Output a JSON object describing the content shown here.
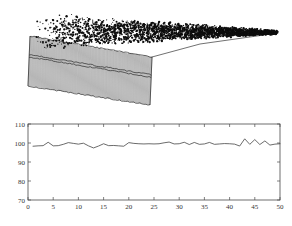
{
  "figure": {
    "background_color": "#ffffff",
    "axis_color": "#4a4a4a",
    "line_color": "#3a3a3a",
    "mesh_color": "#2a2a2a",
    "noise_color": "#0d0d0d"
  },
  "panels": {
    "surface": {
      "name": "3d-waterfall-surface-plot",
      "description": "3D waterfall / surface mesh plot with dense dark noise on the top surface and vertically hatched side walls"
    },
    "line": {
      "name": "2d-line-plot",
      "description": "2D time-series line plot of a noisy signal"
    }
  },
  "chart_data": [
    {
      "type": "surface",
      "title": "",
      "xlabel": "",
      "ylabel": "",
      "zlabel": "",
      "grid": false,
      "legend": null,
      "axis_visible": false,
      "n_rows": 3,
      "n_cols": 60,
      "surface_texture": "dense random noise speckle",
      "wall_texture": "dense vertical mesh lines"
    },
    {
      "type": "line",
      "title": "",
      "xlabel": "",
      "ylabel": "",
      "grid": false,
      "legend": null,
      "xlim": [
        0,
        50
      ],
      "ylim": [
        70,
        110
      ],
      "xticks": [
        0,
        5,
        10,
        15,
        20,
        25,
        30,
        35,
        40,
        45,
        50
      ],
      "yticks": [
        70,
        80,
        90,
        100,
        110
      ],
      "xticklabels": [
        "0",
        "5",
        "10",
        "15",
        "20",
        "25",
        "30",
        "35",
        "40",
        "45",
        "50"
      ],
      "yticklabels": [
        "70",
        "80",
        "90",
        "100",
        "110"
      ],
      "series": [
        {
          "name": "signal",
          "color": "#3a3a3a",
          "x": [
            1,
            2,
            3,
            4,
            5,
            6,
            7,
            8,
            9,
            10,
            11,
            12,
            13,
            14,
            15,
            16,
            17,
            18,
            19,
            20,
            21,
            22,
            23,
            24,
            25,
            26,
            27,
            28,
            29,
            30,
            31,
            32,
            33,
            34,
            35,
            36,
            37,
            38,
            39,
            40,
            41,
            42,
            43,
            44,
            45,
            46,
            47,
            48,
            49,
            50
          ],
          "values": [
            98.3,
            98.5,
            98.6,
            100.4,
            98.5,
            98.6,
            99.3,
            100.2,
            99.8,
            99.4,
            99.9,
            98.5,
            97.4,
            98.4,
            99.6,
            98.6,
            98.7,
            98.5,
            98.3,
            100.2,
            99.8,
            99.6,
            99.5,
            99.6,
            99.5,
            99.6,
            100.1,
            100.5,
            99.5,
            99.6,
            100.4,
            99.2,
            100.3,
            99.3,
            99.5,
            100.3,
            99.3,
            99.5,
            99.7,
            99.6,
            99.4,
            98.4,
            102.2,
            99.3,
            101.8,
            99.2,
            101.1,
            98.9,
            99.4,
            99.6
          ]
        }
      ]
    }
  ]
}
